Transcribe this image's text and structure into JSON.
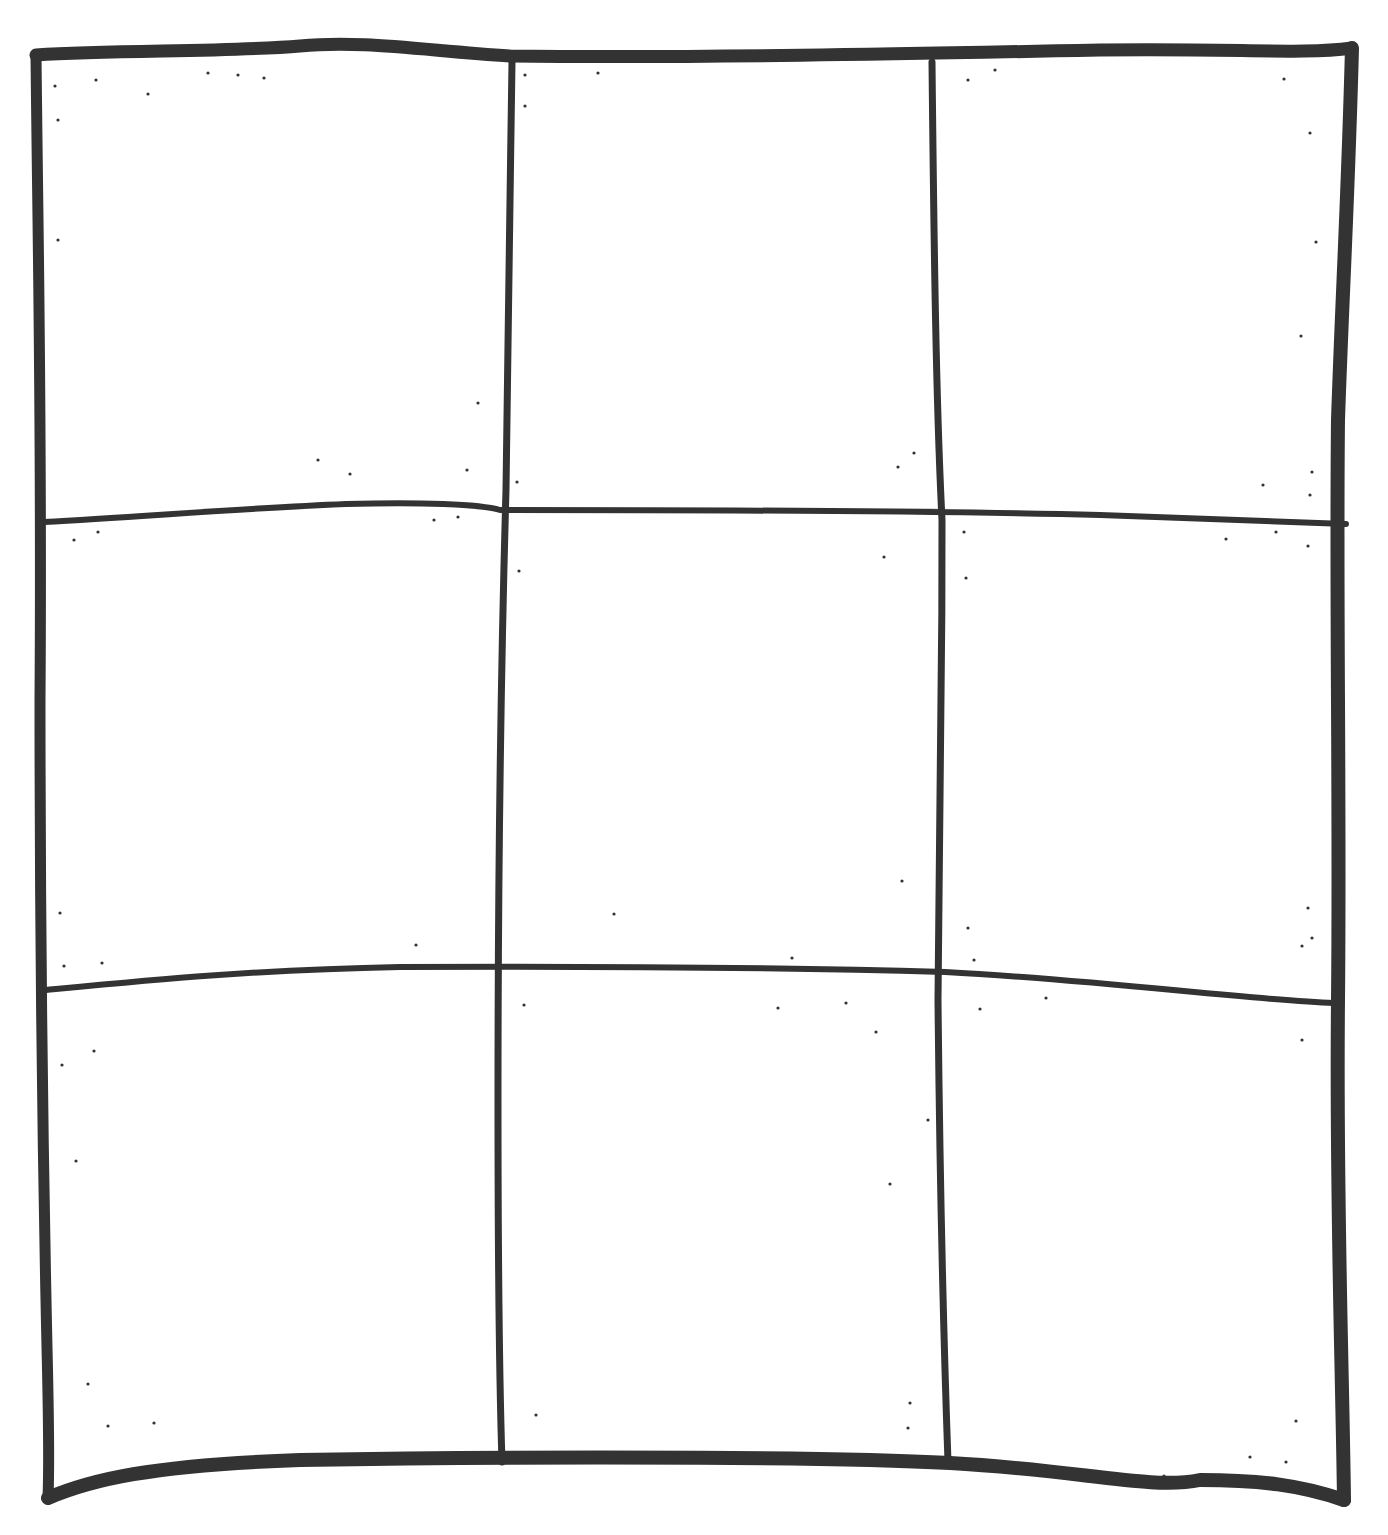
{
  "diagram": {
    "title": "",
    "type": "hand-drawn 3x3 grid",
    "rows": 3,
    "columns": 3,
    "ink_color": "#333333",
    "background": "#ffffff",
    "outer_border": {
      "top": "M 36 55 C 120 50, 230 52, 300 46 C 360 40, 420 50, 510 56 C 700 58, 900 54, 1100 50 C 1240 48, 1300 55, 1352 48",
      "right": "M 1352 48 C 1348 200, 1342 300, 1338 420 C 1336 600, 1340 800, 1338 1000 C 1336 1200, 1342 1350, 1344 1500",
      "bottom": "M 48 1498 C 90 1480, 150 1465, 300 1460 C 600 1455, 850 1458, 950 1463 C 1080 1470, 1150 1490, 1200 1480 C 1260 1480, 1300 1485, 1344 1500",
      "left": "M 36 55 C 38 250, 42 420, 40 700 C 40 950, 44 1200, 46 1300 C 48 1400, 50 1450, 48 1498"
    },
    "inner_lines": {
      "vertical": [
        "M 512 62 C 510 200, 508 330, 506 490 C 500 700, 498 900, 498 1100 C 498 1300, 500 1400, 502 1462",
        "M 932 62 C 934 250, 936 400, 942 520 C 942 700, 940 900, 938 1000 C 940 1200, 944 1350, 948 1462"
      ],
      "horizontal": [
        "M 44 522 C 150 516, 250 508, 346 504 C 420 502, 480 504, 500 510 C 700 510, 950 511, 1100 515 C 1200 518, 1300 522, 1346 524",
        "M 46 990 C 150 980, 250 970, 400 967 C 600 966, 800 968, 945 972 C 1100 980, 1250 1000, 1334 1003"
      ]
    },
    "panels": [
      {
        "row": 1,
        "col": 1,
        "content": ""
      },
      {
        "row": 1,
        "col": 2,
        "content": ""
      },
      {
        "row": 1,
        "col": 3,
        "content": ""
      },
      {
        "row": 2,
        "col": 1,
        "content": ""
      },
      {
        "row": 2,
        "col": 2,
        "content": ""
      },
      {
        "row": 2,
        "col": 3,
        "content": ""
      },
      {
        "row": 3,
        "col": 1,
        "content": ""
      },
      {
        "row": 3,
        "col": 2,
        "content": ""
      },
      {
        "row": 3,
        "col": 3,
        "content": ""
      }
    ],
    "speckles": [
      [
        96,
        80
      ],
      [
        148,
        94
      ],
      [
        208,
        73
      ],
      [
        238,
        75
      ],
      [
        264,
        78
      ],
      [
        55,
        86
      ],
      [
        58,
        120
      ],
      [
        58,
        240
      ],
      [
        478,
        403
      ],
      [
        318,
        460
      ],
      [
        350,
        474
      ],
      [
        467,
        470
      ],
      [
        525,
        75
      ],
      [
        525,
        106
      ],
      [
        598,
        73
      ],
      [
        914,
        453
      ],
      [
        898,
        467
      ],
      [
        517,
        482
      ],
      [
        968,
        80
      ],
      [
        995,
        70
      ],
      [
        1284,
        79
      ],
      [
        1310,
        133
      ],
      [
        1316,
        242
      ],
      [
        1301,
        336
      ],
      [
        1263,
        485
      ],
      [
        1310,
        495
      ],
      [
        1312,
        472
      ],
      [
        74,
        540
      ],
      [
        98,
        532
      ],
      [
        434,
        520
      ],
      [
        458,
        517
      ],
      [
        519,
        571
      ],
      [
        884,
        557
      ],
      [
        964,
        532
      ],
      [
        1226,
        539
      ],
      [
        1276,
        532
      ],
      [
        1308,
        546
      ],
      [
        966,
        578
      ],
      [
        60,
        913
      ],
      [
        64,
        966
      ],
      [
        102,
        963
      ],
      [
        416,
        945
      ],
      [
        614,
        914
      ],
      [
        902,
        881
      ],
      [
        792,
        958
      ],
      [
        968,
        928
      ],
      [
        974,
        960
      ],
      [
        1308,
        908
      ],
      [
        1312,
        938
      ],
      [
        1302,
        946
      ],
      [
        94,
        1051
      ],
      [
        62,
        1065
      ],
      [
        524,
        1005
      ],
      [
        778,
        1008
      ],
      [
        846,
        1003
      ],
      [
        876,
        1032
      ],
      [
        980,
        1009
      ],
      [
        1046,
        998
      ],
      [
        1302,
        1040
      ],
      [
        928,
        1120
      ],
      [
        890,
        1184
      ],
      [
        76,
        1161
      ],
      [
        88,
        1384
      ],
      [
        108,
        1426
      ],
      [
        154,
        1423
      ],
      [
        536,
        1415
      ],
      [
        910,
        1403
      ],
      [
        908,
        1428
      ],
      [
        1296,
        1421
      ],
      [
        1250,
        1457
      ],
      [
        1286,
        1462
      ],
      [
        1164,
        1476
      ]
    ]
  }
}
